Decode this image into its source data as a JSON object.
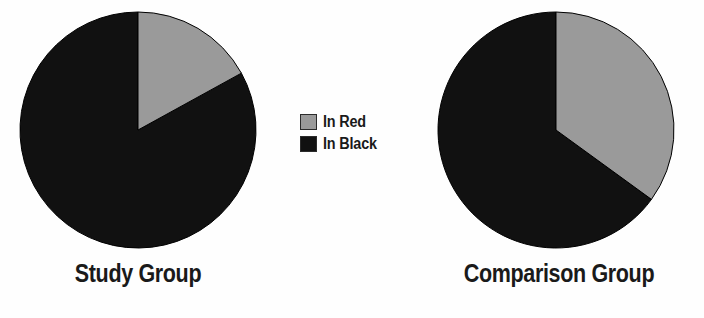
{
  "figure": {
    "background_color": "#fefefe"
  },
  "legend": {
    "position": "center-middle",
    "items": [
      {
        "label": "In Red",
        "color": "#9a9a9a",
        "border": "#2b2b2b",
        "swatch_name": "legend-swatch-in-red"
      },
      {
        "label": "In Black",
        "color": "#111111",
        "border": "#2b2b2b",
        "swatch_name": "legend-swatch-in-black"
      }
    ]
  },
  "panels": [
    {
      "id": "study",
      "title": "Study Group"
    },
    {
      "id": "compare",
      "title": "Comparison Group"
    }
  ],
  "chart_data": [
    {
      "type": "pie",
      "title": "Study Group",
      "labels": [
        "In Red",
        "In Black"
      ],
      "values": [
        17,
        83
      ],
      "colors": [
        "#9a9a9a",
        "#111111"
      ],
      "start_angle": 90,
      "direction": "clockwise",
      "legend": [
        "In Red",
        "In Black"
      ],
      "legend_position": "center-middle",
      "grid": false
    },
    {
      "type": "pie",
      "title": "Comparison Group",
      "labels": [
        "In Red",
        "In Black"
      ],
      "values": [
        35,
        65
      ],
      "colors": [
        "#9a9a9a",
        "#111111"
      ],
      "start_angle": 90,
      "direction": "clockwise",
      "legend": [
        "In Red",
        "In Black"
      ],
      "legend_position": "center-middle",
      "grid": false
    }
  ]
}
